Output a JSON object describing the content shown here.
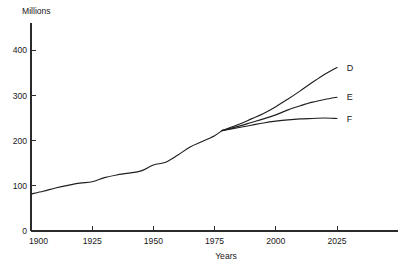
{
  "chart_data": {
    "type": "line",
    "title": "",
    "subtitle": "",
    "xlabel": "Years",
    "ylabel": "Millions",
    "xlim": [
      1900,
      2040
    ],
    "ylim": [
      0,
      430
    ],
    "xticks": [
      1900,
      1925,
      1950,
      1975,
      2000,
      2025
    ],
    "xticklabels": [
      "1900",
      "1925",
      "1950",
      "1975",
      "2000",
      "2025"
    ],
    "yticks": [
      0,
      100,
      200,
      300,
      400
    ],
    "yticklabels": [
      "0",
      "100",
      "200",
      "300",
      "400"
    ],
    "grid": false,
    "legend_position": "right-inline-labels",
    "annotations": [
      {
        "text": "D",
        "x": 2029,
        "y": 362
      },
      {
        "text": "E",
        "x": 2029,
        "y": 296
      },
      {
        "text": "F",
        "x": 2029,
        "y": 249
      }
    ],
    "series": [
      {
        "name": "historical",
        "label": "",
        "color": "#1f1f1f",
        "x": [
          1900,
          1905,
          1910,
          1915,
          1920,
          1925,
          1930,
          1935,
          1940,
          1945,
          1950,
          1955,
          1960,
          1965,
          1970,
          1975,
          1978
        ],
        "y": [
          82,
          88,
          95,
          101,
          106,
          109,
          118,
          124,
          128,
          133,
          146,
          152,
          168,
          186,
          198,
          211,
          222
        ]
      },
      {
        "name": "D",
        "label": "D",
        "color": "#1f1f1f",
        "x": [
          1978,
          1985,
          1990,
          1995,
          2000,
          2005,
          2010,
          2015,
          2020,
          2025
        ],
        "y": [
          222,
          236,
          248,
          260,
          275,
          292,
          310,
          329,
          347,
          362
        ]
      },
      {
        "name": "E",
        "label": "E",
        "color": "#1f1f1f",
        "x": [
          1978,
          1985,
          1990,
          1995,
          2000,
          2005,
          2010,
          2015,
          2020,
          2025
        ],
        "y": [
          222,
          232,
          240,
          248,
          257,
          268,
          277,
          285,
          291,
          296
        ]
      },
      {
        "name": "F",
        "label": "F",
        "color": "#1f1f1f",
        "x": [
          1978,
          1985,
          1990,
          1995,
          2000,
          2005,
          2010,
          2015,
          2020,
          2025
        ],
        "y": [
          222,
          229,
          234,
          239,
          243,
          246,
          248,
          249,
          250,
          249
        ]
      }
    ]
  },
  "axes": {
    "y_title": "Millions",
    "x_title": "Years",
    "y_tick_labels": [
      "400",
      "300",
      "200",
      "100",
      "0"
    ],
    "x_tick_labels": [
      "1900",
      "1925",
      "1950",
      "1975",
      "2000",
      "2025"
    ]
  },
  "series_labels": {
    "d": "D",
    "e": "E",
    "f": "F"
  },
  "colors": {
    "line": "#1f1f1f",
    "axis": "#2b2b2b",
    "text": "#1a1a1a",
    "background": "#ffffff"
  }
}
